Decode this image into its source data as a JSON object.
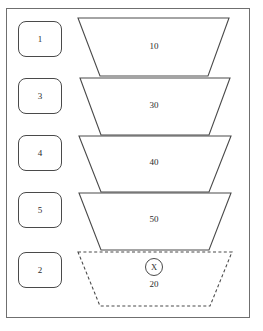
{
  "diagram": {
    "frame": {
      "border_color": "#6f6f6f"
    },
    "stage_labels": [
      {
        "text": "1"
      },
      {
        "text": "3"
      },
      {
        "text": "4"
      },
      {
        "text": "5"
      },
      {
        "text": "2"
      }
    ],
    "stages": [
      {
        "value": "10",
        "style": "solid",
        "top_y": 18,
        "bottom_y": 76,
        "top_left": 78,
        "top_right": 229,
        "bottom_left": 100,
        "bottom_right": 208
      },
      {
        "value": "30",
        "style": "solid",
        "top_y": 78,
        "bottom_y": 135,
        "top_left": 80,
        "top_right": 230,
        "bottom_left": 101,
        "bottom_right": 209
      },
      {
        "value": "40",
        "style": "solid",
        "top_y": 136,
        "bottom_y": 192,
        "top_left": 79,
        "top_right": 231,
        "bottom_left": 101,
        "bottom_right": 209
      },
      {
        "value": "50",
        "style": "solid",
        "top_y": 193,
        "bottom_y": 250,
        "top_left": 79,
        "top_right": 231,
        "bottom_left": 101,
        "bottom_right": 209
      },
      {
        "value": "20",
        "style": "dashed",
        "top_y": 252,
        "bottom_y": 306,
        "top_left": 78,
        "top_right": 232,
        "bottom_left": 100,
        "bottom_right": 210
      }
    ],
    "marker": {
      "text": "X"
    },
    "colors": {
      "outline": "#4a4a4a",
      "frame": "#6f6f6f",
      "text": "#2b2b2b",
      "background": "#ffffff"
    }
  }
}
